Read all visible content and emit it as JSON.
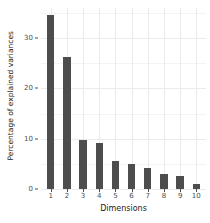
{
  "chart_data": {
    "type": "bar",
    "title": "",
    "subtitle": "",
    "xlabel": "Dimensions",
    "ylabel": "Percentage of explained variances",
    "categories": [
      "1",
      "2",
      "3",
      "4",
      "5",
      "6",
      "7",
      "8",
      "9",
      "10"
    ],
    "values": [
      34.6,
      26.2,
      9.7,
      9.1,
      5.6,
      5.0,
      4.2,
      3.0,
      2.6,
      1.0
    ],
    "series": [
      {
        "name": "Percentage of explained variances",
        "values": [
          34.6,
          26.2,
          9.7,
          9.1,
          5.6,
          5.0,
          4.2,
          3.0,
          2.6,
          1.0
        ]
      }
    ],
    "ylim": [
      0,
      36
    ],
    "xlim": [
      0.4,
      10.6
    ],
    "ytick_values": [
      0,
      10,
      20,
      30
    ],
    "ytick_labels": [
      "0",
      "10",
      "20",
      "30"
    ],
    "yminor_values": [
      5,
      15,
      25,
      35
    ],
    "xtick_labels": [
      "1",
      "2",
      "3",
      "4",
      "5",
      "6",
      "7",
      "8",
      "9",
      "10"
    ],
    "grid": true,
    "legend": false,
    "legend_position": "none",
    "bar_color": "#4d4d4d",
    "panel_background": "#ffffff",
    "gridline_color": "#ebebeb",
    "axis_text_color": "#4d4d4d",
    "axis_title_color": "#1a1a1a",
    "bar_width_fraction": 0.45
  }
}
